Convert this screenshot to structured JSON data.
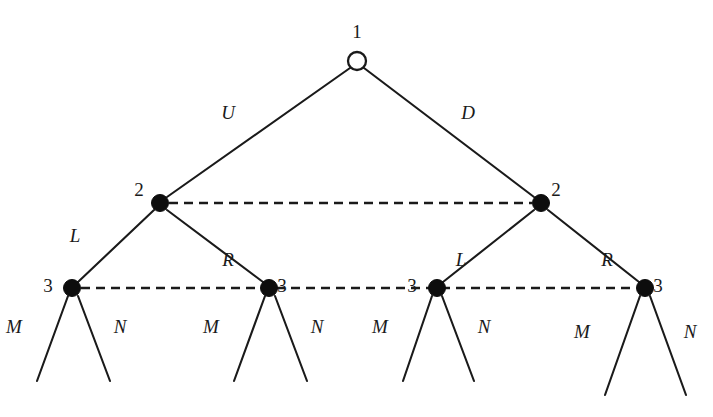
{
  "figure": {
    "type": "game-tree",
    "background_color": "#ffffff",
    "line_color": "#1a1a1a",
    "node_fill_decision": "#0d0d0d",
    "node_fill_root": "#ffffff"
  },
  "nodes": [
    {
      "id": "root",
      "player_label": "1",
      "style": "open",
      "x": 357,
      "y": 61,
      "r": 9,
      "label_dx": 0,
      "label_dy": -30
    },
    {
      "id": "n2L",
      "player_label": "2",
      "style": "filled",
      "x": 160,
      "y": 203,
      "r": 8.5,
      "label_dx": -21,
      "label_dy": -14
    },
    {
      "id": "n2R",
      "player_label": "2",
      "style": "filled",
      "x": 541,
      "y": 203,
      "r": 8.5,
      "label_dx": 15,
      "label_dy": -14
    },
    {
      "id": "n3a",
      "player_label": "3",
      "style": "filled",
      "x": 72,
      "y": 288,
      "r": 8.5,
      "label_dx": -24,
      "label_dy": -3
    },
    {
      "id": "n3b",
      "player_label": "3",
      "style": "filled",
      "x": 269,
      "y": 288,
      "r": 8.5,
      "label_dx": 13,
      "label_dy": -3
    },
    {
      "id": "n3c",
      "player_label": "3",
      "style": "filled",
      "x": 437,
      "y": 288,
      "r": 8.5,
      "label_dx": -25,
      "label_dy": -3
    },
    {
      "id": "n3d",
      "player_label": "3",
      "style": "filled",
      "x": 645,
      "y": 288,
      "r": 8.5,
      "label_dx": 13,
      "label_dy": -3
    }
  ],
  "edges": [
    {
      "id": "e-root-U",
      "from": "root",
      "to": "n2L",
      "x1": 350,
      "y1": 68,
      "x2": 167,
      "y2": 197,
      "action": "U",
      "label_x": 228,
      "label_y": 112
    },
    {
      "id": "e-root-D",
      "from": "root",
      "to": "n2R",
      "x1": 364,
      "y1": 68,
      "x2": 534,
      "y2": 197,
      "action": "D",
      "label_x": 468,
      "label_y": 112
    },
    {
      "id": "e-2L-L",
      "from": "n2L",
      "to": "n3a",
      "x1": 154,
      "y1": 210,
      "x2": 78,
      "y2": 282,
      "action": "L",
      "label_x": 75,
      "label_y": 235
    },
    {
      "id": "e-2L-R",
      "from": "n2L",
      "to": "n3b",
      "x1": 167,
      "y1": 210,
      "x2": 263,
      "y2": 282,
      "action": "R",
      "label_x": 228,
      "label_y": 259
    },
    {
      "id": "e-2R-L",
      "from": "n2R",
      "to": "n3c",
      "x1": 534,
      "y1": 210,
      "x2": 443,
      "y2": 282,
      "action": "L",
      "label_x": 461,
      "label_y": 259
    },
    {
      "id": "e-2R-R",
      "from": "n2R",
      "to": "n3d",
      "x1": 548,
      "y1": 210,
      "x2": 639,
      "y2": 282,
      "action": "R",
      "label_x": 607,
      "label_y": 259
    }
  ],
  "information_sets": [
    {
      "id": "iset-player2",
      "player_label": "2",
      "style": "dashed",
      "x1": 169,
      "y1": 203,
      "x2": 532,
      "y2": 203
    },
    {
      "id": "iset-player3",
      "player_label": "3",
      "style": "dashed",
      "x1": 81,
      "y1": 288,
      "x2": 636,
      "y2": 288
    }
  ],
  "terminal_branches": [
    {
      "id": "t-a-M",
      "parent": "n3a",
      "action": "M",
      "x1": 68,
      "y1": 296,
      "x2": 37,
      "y2": 381,
      "label_x": 14,
      "label_y": 326
    },
    {
      "id": "t-a-N",
      "parent": "n3a",
      "action": "N",
      "x1": 78,
      "y1": 296,
      "x2": 110,
      "y2": 381,
      "label_x": 120,
      "label_y": 326
    },
    {
      "id": "t-b-M",
      "parent": "n3b",
      "action": "M",
      "x1": 265,
      "y1": 296,
      "x2": 234,
      "y2": 381,
      "label_x": 211,
      "label_y": 326
    },
    {
      "id": "t-b-N",
      "parent": "n3b",
      "action": "N",
      "x1": 275,
      "y1": 296,
      "x2": 307,
      "y2": 381,
      "label_x": 317,
      "label_y": 326
    },
    {
      "id": "t-c-M",
      "parent": "n3c",
      "action": "M",
      "x1": 432,
      "y1": 296,
      "x2": 403,
      "y2": 381,
      "label_x": 380,
      "label_y": 326
    },
    {
      "id": "t-c-N",
      "parent": "n3c",
      "action": "N",
      "x1": 442,
      "y1": 296,
      "x2": 474,
      "y2": 381,
      "label_x": 484,
      "label_y": 326
    },
    {
      "id": "t-d-M",
      "parent": "n3d",
      "action": "M",
      "x1": 640,
      "y1": 296,
      "x2": 605,
      "y2": 395,
      "label_x": 582,
      "label_y": 331
    },
    {
      "id": "t-d-N",
      "parent": "n3d",
      "action": "N",
      "x1": 650,
      "y1": 296,
      "x2": 686,
      "y2": 395,
      "label_x": 690,
      "label_y": 331
    }
  ]
}
